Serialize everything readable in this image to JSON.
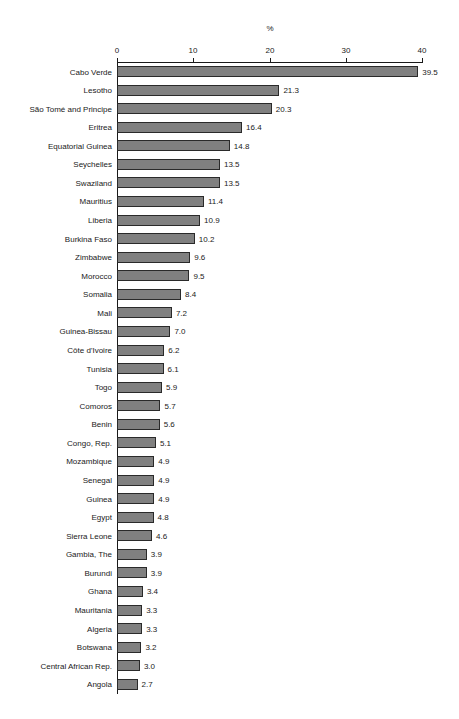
{
  "chart_data": {
    "type": "bar",
    "orientation": "horizontal",
    "title": "",
    "xlabel": "%",
    "ylabel": "",
    "xlim": [
      0,
      40
    ],
    "xticks": [
      0,
      10,
      20,
      30,
      40
    ],
    "xtick_labels": [
      "0",
      "10",
      "20",
      "30",
      "40"
    ],
    "grid": false,
    "legend": null,
    "axis_title_position": "top-center",
    "value_labels": true,
    "value_label_format": "one-decimal",
    "bar_color": "#808080",
    "bar_border_color": "#2a2a2a",
    "axis_color": "#1a1a1a",
    "background_color": "#ffffff",
    "categories": [
      "Cabo Verde",
      "Lesotho",
      "São Tomé and Principe",
      "Eritrea",
      "Equatorial Guinea",
      "Seychelles",
      "Swaziland",
      "Mauritius",
      "Liberia",
      "Burkina Faso",
      "Zimbabwe",
      "Morocco",
      "Somalia",
      "Mali",
      "Guinea-Bissau",
      "Côte d'Ivoire",
      "Tunisia",
      "Togo",
      "Comoros",
      "Benin",
      "Congo, Rep.",
      "Mozambique",
      "Senegal",
      "Guinea",
      "Egypt",
      "Sierra Leone",
      "Gambia, The",
      "Burundi",
      "Ghana",
      "Mauritania",
      "Algeria",
      "Botswana",
      "Central African Rep.",
      "Angola"
    ],
    "values": [
      39.5,
      21.3,
      20.3,
      16.4,
      14.8,
      13.5,
      13.5,
      11.4,
      10.9,
      10.2,
      9.6,
      9.5,
      8.4,
      7.2,
      7.0,
      6.2,
      6.1,
      5.9,
      5.7,
      5.6,
      5.1,
      4.9,
      4.9,
      4.9,
      4.8,
      4.6,
      3.9,
      3.9,
      3.4,
      3.3,
      3.3,
      3.2,
      3.0,
      2.7
    ],
    "value_labels_text": [
      "39.5",
      "21.3",
      "20.3",
      "16.4",
      "14.8",
      "13.5",
      "13.5",
      "11.4",
      "10.9",
      "10.2",
      "9.6",
      "9.5",
      "8.4",
      "7.2",
      "7.0",
      "6.2",
      "6.1",
      "5.9",
      "5.7",
      "5.6",
      "5.1",
      "4.9",
      "4.9",
      "4.9",
      "4.8",
      "4.6",
      "3.9",
      "3.9",
      "3.4",
      "3.3",
      "3.3",
      "3.2",
      "3.0",
      "2.7"
    ]
  }
}
